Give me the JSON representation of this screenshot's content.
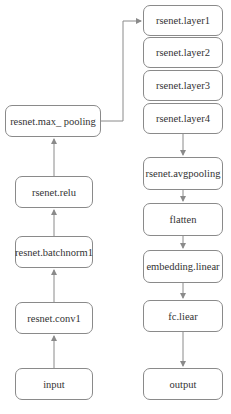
{
  "diagram": {
    "left_column": [
      {
        "id": "input",
        "label": "input"
      },
      {
        "id": "conv1",
        "label": "resnet.conv1"
      },
      {
        "id": "batchnorm1",
        "label": "resnet.batchnorm1"
      },
      {
        "id": "relu",
        "label": "rsenet.relu"
      },
      {
        "id": "max_pooling",
        "label": "resnet.max_ pooling"
      }
    ],
    "right_column": [
      {
        "id": "layer1",
        "label": "rsenet.layer1"
      },
      {
        "id": "layer2",
        "label": "rsenet.layer2"
      },
      {
        "id": "layer3",
        "label": "rsenet.layer3"
      },
      {
        "id": "layer4",
        "label": "rsenet.layer4"
      },
      {
        "id": "avgpooling",
        "label": "rsenet.avgpooling"
      },
      {
        "id": "flatten",
        "label": "flatten"
      },
      {
        "id": "embedding_linear",
        "label": "embedding.linear"
      },
      {
        "id": "fc_liear",
        "label": "fc.liear"
      },
      {
        "id": "output",
        "label": "output"
      }
    ],
    "edges": [
      [
        "input",
        "conv1"
      ],
      [
        "conv1",
        "batchnorm1"
      ],
      [
        "batchnorm1",
        "relu"
      ],
      [
        "relu",
        "max_pooling"
      ],
      [
        "max_pooling",
        "layer1"
      ],
      [
        "layer4",
        "avgpooling"
      ],
      [
        "avgpooling",
        "flatten"
      ],
      [
        "flatten",
        "embedding_linear"
      ],
      [
        "embedding_linear",
        "fc_liear"
      ],
      [
        "fc_liear",
        "output"
      ]
    ],
    "colors": {
      "stroke": "#8a8a8a",
      "text": "#333333",
      "background": "#ffffff"
    }
  }
}
